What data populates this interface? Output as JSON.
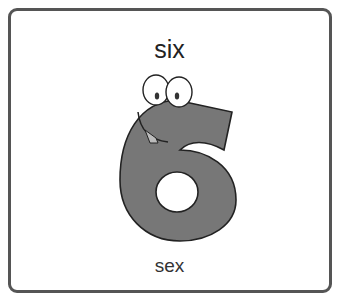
{
  "card": {
    "word": "six",
    "translation": "sex",
    "illustration": "cartoon-number-six",
    "colors": {
      "border": "#555555",
      "figure_fill": "#777777",
      "outline": "#222222"
    }
  }
}
